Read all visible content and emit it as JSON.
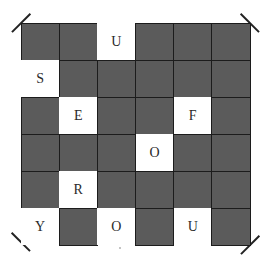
{
  "puzzle": {
    "title": "",
    "rows": 6,
    "cols": 6,
    "colors": {
      "black_cell": "#5b5b5b",
      "grid_line": "#1c1c1c",
      "white_cell": "#ffffff",
      "letter": "#2a2a2a"
    },
    "cells": [
      [
        {
          "type": "black",
          "letter": ""
        },
        {
          "type": "black",
          "letter": ""
        },
        {
          "type": "white",
          "letter": "U"
        },
        {
          "type": "black",
          "letter": ""
        },
        {
          "type": "black",
          "letter": ""
        },
        {
          "type": "black",
          "letter": ""
        }
      ],
      [
        {
          "type": "white",
          "letter": "S"
        },
        {
          "type": "black",
          "letter": ""
        },
        {
          "type": "black",
          "letter": ""
        },
        {
          "type": "black",
          "letter": ""
        },
        {
          "type": "black",
          "letter": ""
        },
        {
          "type": "black",
          "letter": ""
        }
      ],
      [
        {
          "type": "black",
          "letter": ""
        },
        {
          "type": "white",
          "letter": "E"
        },
        {
          "type": "black",
          "letter": ""
        },
        {
          "type": "black",
          "letter": ""
        },
        {
          "type": "white",
          "letter": "F"
        },
        {
          "type": "black",
          "letter": ""
        }
      ],
      [
        {
          "type": "black",
          "letter": ""
        },
        {
          "type": "black",
          "letter": ""
        },
        {
          "type": "black",
          "letter": ""
        },
        {
          "type": "white",
          "letter": "O"
        },
        {
          "type": "black",
          "letter": ""
        },
        {
          "type": "black",
          "letter": ""
        }
      ],
      [
        {
          "type": "black",
          "letter": ""
        },
        {
          "type": "white",
          "letter": "R"
        },
        {
          "type": "black",
          "letter": ""
        },
        {
          "type": "black",
          "letter": ""
        },
        {
          "type": "black",
          "letter": ""
        },
        {
          "type": "black",
          "letter": ""
        }
      ],
      [
        {
          "type": "white",
          "letter": "Y"
        },
        {
          "type": "black",
          "letter": ""
        },
        {
          "type": "white",
          "letter": "O"
        },
        {
          "type": "black",
          "letter": ""
        },
        {
          "type": "white",
          "letter": "U"
        },
        {
          "type": "black",
          "letter": ""
        }
      ]
    ]
  }
}
